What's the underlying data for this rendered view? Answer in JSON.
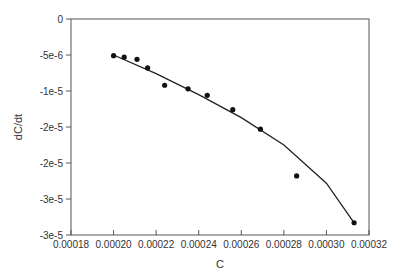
{
  "chart_data": {
    "type": "scatter",
    "title": "",
    "xlabel": "C",
    "ylabel": "dC/dt",
    "xlim": [
      0.00018,
      0.00032
    ],
    "ylim": [
      -3e-05,
      0
    ],
    "grid": false,
    "legend": null,
    "x_ticks": [
      0.00018,
      0.0002,
      0.00022,
      0.00024,
      0.00026,
      0.00028,
      0.0003,
      0.00032
    ],
    "x_tick_labels": [
      "0.00018",
      "0.00020",
      "0.00022",
      "0.00024",
      "0.00026",
      "0.00028",
      "0.00030",
      "0.00032"
    ],
    "y_ticks": [
      0,
      -5e-06,
      -1e-05,
      -1.5e-05,
      -2e-05,
      -2.5e-05,
      -3e-05
    ],
    "y_tick_labels": [
      "0",
      "-5e-6",
      "-1e-5",
      "-2e-5",
      "-2e-5",
      "-3e-5",
      "-3e-5"
    ],
    "series": [
      {
        "name": "data",
        "kind": "scatter",
        "x": [
          0.0002,
          0.000205,
          0.000211,
          0.000216,
          0.000224,
          0.000235,
          0.000244,
          0.000256,
          0.000269,
          0.000286,
          0.000313
        ],
        "y": [
          -5.1e-06,
          -5.3e-06,
          -5.6e-06,
          -6.8e-06,
          -9.2e-06,
          -9.7e-06,
          -1.06e-05,
          -1.26e-05,
          -1.53e-05,
          -2.18e-05,
          -2.83e-05
        ]
      },
      {
        "name": "fit",
        "kind": "line",
        "x": [
          0.0002,
          0.00022,
          0.00024,
          0.00026,
          0.00028,
          0.0003,
          0.000313
        ],
        "y": [
          -5e-06,
          -7.6e-06,
          -1.05e-05,
          -1.37e-05,
          -1.75e-05,
          -2.28e-05,
          -2.83e-05
        ]
      }
    ]
  }
}
